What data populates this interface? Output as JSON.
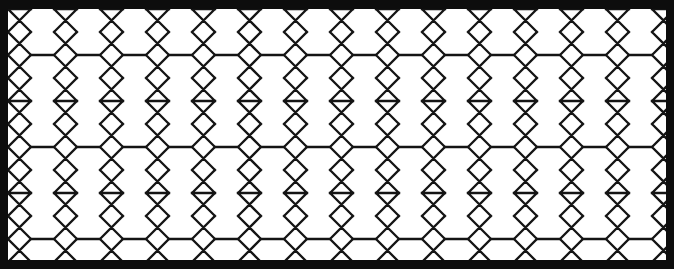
{
  "artwork": {
    "title": "Interlaced six-pointed star lattice panel",
    "style": "Islamic geometric tessellation",
    "description": "A rectangular panel bounded by a thick solid black frame enclosing a white field filled edge-to-edge with an interlacing lattice of six-pointed stars (hexagrams) and elongated hexagons drawn in thin black line.",
    "orientation": "landscape"
  },
  "canvas": {
    "width": 674,
    "height": 269,
    "background_color": "#ffffff"
  },
  "frame": {
    "name": "outer-border",
    "color": "#0d0d0d",
    "top_thickness": 9,
    "bottom_thickness": 9,
    "left_thickness": 8,
    "right_thickness": 8
  },
  "field": {
    "x": 8,
    "y": 9,
    "width": 658,
    "height": 251,
    "background_color": "#ffffff"
  },
  "pattern": {
    "name": "hexagram-lattice",
    "motif": "six-pointed star",
    "secondary_motif": "elongated hexagon",
    "line_color": "#141414",
    "line_width": 2.3,
    "cell_width": 46,
    "cell_height": 92,
    "star_rows": 5,
    "star_columns": 15,
    "row_offset": 23,
    "horizontal_band_count": 6,
    "interlacing": "triangles overlap to form continuous zig-zag strapwork"
  },
  "geometry": {
    "unit_width": 46,
    "unit_height": 92,
    "quarter": 23,
    "sixth": 15.33,
    "band_y_values": [
      0,
      46,
      92,
      138,
      184,
      230
    ],
    "star_center_y_values": [
      23,
      69,
      115,
      161,
      207
    ],
    "notes": "Each star is built from two overlapping equilateral triangles; adjacent columns are phase-shifted by half a unit vertically."
  },
  "palette": {
    "black": "#0d0d0d",
    "line": "#141414",
    "white": "#ffffff"
  }
}
